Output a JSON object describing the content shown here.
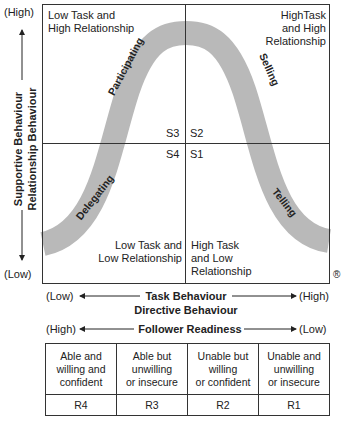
{
  "diagram": {
    "y_axis": {
      "high": "(High)",
      "low": "(Low)",
      "label_line1": "Supportive Behaviour",
      "label_line2": "Relationship Behaviour"
    },
    "x_axis": {
      "low": "(Low)",
      "high": "(High)",
      "label_line1": "Task Behaviour",
      "label_line2": "Directive Behaviour"
    },
    "quadrants": {
      "top_left": [
        "Low Task and",
        "High Relationship"
      ],
      "top_right": [
        "HighTask",
        "and High",
        "Relationship"
      ],
      "bottom_left": [
        "Low Task and",
        "Low Relationship"
      ],
      "bottom_right": [
        "High Task",
        "and Low",
        "Relationship"
      ]
    },
    "styles": {
      "S3": "S3",
      "S2": "S2",
      "S4": "S4",
      "S1": "S1"
    },
    "curve_labels": {
      "participating": "Participating",
      "selling": "Selling",
      "delegating": "Delegating",
      "telling": "Telling"
    },
    "registered_mark": "®",
    "colors": {
      "band": "#b9b9b9",
      "line": "#333333"
    }
  },
  "readiness": {
    "high": "(High)",
    "low": "(Low)",
    "label": "Follower Readiness",
    "columns": [
      {
        "desc": [
          "Able and",
          "willing and",
          "confident"
        ],
        "code": "R4"
      },
      {
        "desc": [
          "Able but",
          "unwilling",
          "or insecure"
        ],
        "code": "R3"
      },
      {
        "desc": [
          "Unable but",
          "willing",
          "or confident"
        ],
        "code": "R2"
      },
      {
        "desc": [
          "Unable and",
          "unwilling",
          "or insecure"
        ],
        "code": "R1"
      }
    ]
  }
}
